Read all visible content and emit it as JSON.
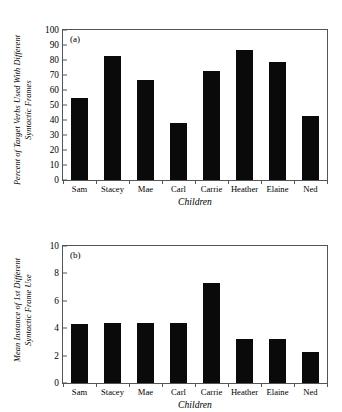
{
  "figure": {
    "background": "#ffffff",
    "bar_color": "#0a0a0a",
    "axis_color": "#555555"
  },
  "chart_data": [
    {
      "type": "bar",
      "panel": "(a)",
      "title": "",
      "categories": [
        "Sam",
        "Stacey",
        "Mae",
        "Carl",
        "Carrie",
        "Heather",
        "Elaine",
        "Ned"
      ],
      "values": [
        55,
        83,
        67,
        38,
        73,
        87,
        79,
        43
      ],
      "xlabel": "Children",
      "ylabel": "Percent of Target Verbs Used With Different Syntactic Frames",
      "ylabel_line1": "Percent of Target Verbs Used With Different",
      "ylabel_line2": "Syntactic Frames",
      "ylim": [
        0,
        100
      ],
      "ytick_step": 10,
      "yticks": [
        0,
        10,
        20,
        30,
        40,
        50,
        60,
        70,
        80,
        90,
        100
      ],
      "grid": false,
      "legend": "none"
    },
    {
      "type": "bar",
      "panel": "(b)",
      "title": "",
      "categories": [
        "Sam",
        "Stacey",
        "Mae",
        "Carl",
        "Carrie",
        "Heather",
        "Elaine",
        "Ned"
      ],
      "values": [
        4.3,
        4.35,
        4.35,
        4.35,
        7.3,
        3.2,
        3.2,
        2.3
      ],
      "xlabel": "Children",
      "ylabel": "Mean Instance of 1st Different Syntactic Frame Use",
      "ylabel_line1": "Mean Instance of 1st Different",
      "ylabel_line2": "Syntactic Frame Use",
      "ylim": [
        0,
        10
      ],
      "ytick_step": 2,
      "yticks": [
        0,
        2,
        4,
        6,
        8,
        10
      ],
      "grid": false,
      "legend": "none"
    }
  ]
}
